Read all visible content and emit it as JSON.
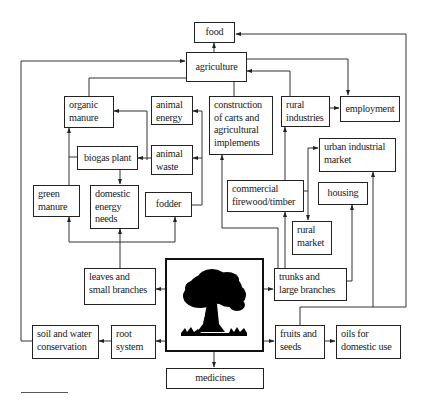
{
  "diagram": {
    "nodes": {
      "food": "food",
      "agriculture": "agriculture",
      "organic_manure": "organic\nmanure",
      "animal_energy": "animal\nenergy",
      "construction": "construction\nof carts and\nagricultural\nimplements",
      "rural_industries": "rural\nindustries",
      "employment": "employment",
      "biogas_plant": "biogas plant",
      "animal_waste": "animal\nwaste",
      "green_manure": "green\nmanure",
      "domestic_energy_needs": "domestic\nenergy\nneeds",
      "fodder": "fodder",
      "urban_industrial_market": "urban industrial\nmarket",
      "commercial_firewood": "commercial\nfirewood/timber",
      "housing": "housing",
      "rural_market": "rural\nmarket",
      "leaves_small_branches": "leaves and\nsmall branches",
      "tree": "tree",
      "trunks_large_branches": "trunks and\nlarge branches",
      "soil_water_conservation": "soil and water\nconservation",
      "root_system": "root\nsystem",
      "fruits_seeds": "fruits and\nseeds",
      "oils_domestic_use": "oils for\ndomestic use",
      "medicines": "medicines"
    },
    "edges": [
      [
        "tree",
        "leaves_small_branches"
      ],
      [
        "tree",
        "trunks_large_branches"
      ],
      [
        "tree",
        "root_system"
      ],
      [
        "tree",
        "fruits_seeds"
      ],
      [
        "tree",
        "medicines"
      ],
      [
        "root_system",
        "soil_water_conservation"
      ],
      [
        "soil_water_conservation",
        "agriculture"
      ],
      [
        "fruits_seeds",
        "oils_domestic_use"
      ],
      [
        "fruits_seeds",
        "food"
      ],
      [
        "fruits_seeds",
        "urban_industrial_market"
      ],
      [
        "leaves_small_branches",
        "green_manure"
      ],
      [
        "leaves_small_branches",
        "domestic_energy_needs"
      ],
      [
        "leaves_small_branches",
        "fodder"
      ],
      [
        "fodder",
        "animal_energy"
      ],
      [
        "fodder",
        "animal_waste"
      ],
      [
        "animal_waste",
        "biogas_plant"
      ],
      [
        "animal_waste",
        "organic_manure"
      ],
      [
        "biogas_plant",
        "domestic_energy_needs"
      ],
      [
        "green_manure",
        "organic_manure"
      ],
      [
        "organic_manure",
        "agriculture"
      ],
      [
        "animal_energy",
        "agriculture"
      ],
      [
        "construction",
        "agriculture"
      ],
      [
        "trunks_large_branches",
        "construction"
      ],
      [
        "trunks_large_branches",
        "commercial_firewood"
      ],
      [
        "trunks_large_branches",
        "housing"
      ],
      [
        "commercial_firewood",
        "rural_industries"
      ],
      [
        "commercial_firewood",
        "urban_industrial_market"
      ],
      [
        "commercial_firewood",
        "rural_market"
      ],
      [
        "rural_industries",
        "agriculture"
      ],
      [
        "rural_industries",
        "employment"
      ],
      [
        "agriculture",
        "employment"
      ],
      [
        "agriculture",
        "food"
      ]
    ]
  }
}
